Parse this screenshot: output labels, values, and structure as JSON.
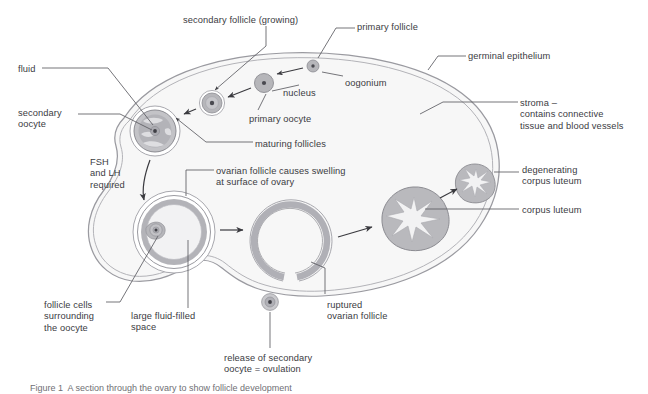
{
  "figure": {
    "kind": "biology-diagram",
    "caption": "Figure 1  A section through the ovary to show follicle development"
  },
  "colors": {
    "outline": "#8c8c92",
    "ovary_fill": "#f7f7f7",
    "follicle_fill": "#b6b6ba",
    "follicle_light": "#d8d8db",
    "corpus_fill": "#b9b9bd",
    "leader_line": "#5c5c62",
    "text": "#3b3b3f",
    "caption_text": "#6f6f74",
    "white": "#ffffff"
  },
  "labels": [
    {
      "id": "secondary-follicle-growing",
      "text": "secondary follicle (growing)",
      "x": 183,
      "y": 15,
      "align": "left"
    },
    {
      "id": "primary-follicle",
      "text": "primary follicle",
      "x": 357,
      "y": 22,
      "align": "left"
    },
    {
      "id": "germinal-epithelium",
      "text": "germinal epithelium",
      "x": 468,
      "y": 51,
      "align": "left"
    },
    {
      "id": "fluid",
      "text": "fluid",
      "x": 18,
      "y": 64,
      "align": "left"
    },
    {
      "id": "oogonium",
      "text": "oogonium",
      "x": 345,
      "y": 78,
      "align": "left"
    },
    {
      "id": "nucleus",
      "text": "nucleus",
      "x": 283,
      "y": 88,
      "align": "left"
    },
    {
      "id": "stroma",
      "text": "stroma –\ncontains connective\ntissue and blood vessels",
      "x": 520,
      "y": 98,
      "align": "left"
    },
    {
      "id": "primary-oocyte",
      "text": "primary oocyte",
      "x": 249,
      "y": 114,
      "align": "left"
    },
    {
      "id": "secondary-oocyte",
      "text": "secondary\noocyte",
      "x": 18,
      "y": 108,
      "align": "left"
    },
    {
      "id": "maturing-follicles",
      "text": "maturing follicles",
      "x": 255,
      "y": 139,
      "align": "left"
    },
    {
      "id": "fsh-and-lh-required",
      "text": "FSH\nand LH\nrequired",
      "x": 90,
      "y": 157,
      "align": "left"
    },
    {
      "id": "ovarian-follicle-swelling",
      "text": "ovarian follicle causes swelling\nat surface of ovary",
      "x": 216,
      "y": 166,
      "align": "left"
    },
    {
      "id": "degenerating-corpus-luteum",
      "text": "degenerating\ncorpus luteum",
      "x": 522,
      "y": 165,
      "align": "left"
    },
    {
      "id": "corpus-luteum",
      "text": "corpus luteum",
      "x": 522,
      "y": 205,
      "align": "left"
    },
    {
      "id": "follicle-cells-surrounding",
      "text": "follicle cells\nsurrounding\nthe oocyte",
      "x": 44,
      "y": 300,
      "align": "left"
    },
    {
      "id": "large-fluid-filled-space",
      "text": "large fluid-filled\nspace",
      "x": 131,
      "y": 311,
      "align": "left"
    },
    {
      "id": "ruptured-ovarian-follicle",
      "text": "ruptured\novarian follicle",
      "x": 327,
      "y": 300,
      "align": "left"
    },
    {
      "id": "release-of-secondary-oocyte",
      "text": "release of secondary\noocyte = ovulation",
      "x": 224,
      "y": 353,
      "align": "left"
    }
  ],
  "structures": [
    {
      "id": "ovary-body",
      "name": "ovary outline with germinal epithelium",
      "cx": 300,
      "cy": 185
    },
    {
      "id": "oogonium-cell",
      "name": "oogonium",
      "cx": 313,
      "cy": 66,
      "r": 6
    },
    {
      "id": "primary-follicle-cell",
      "name": "primary follicle",
      "cx": 264,
      "cy": 83,
      "r": 9.5
    },
    {
      "id": "secondary-follicle-cell",
      "name": "secondary follicle (growing)",
      "cx": 212,
      "cy": 103,
      "r": 12
    },
    {
      "id": "maturing-follicle-cell",
      "name": "maturing follicle with secondary oocyte and fluid",
      "cx": 155,
      "cy": 131,
      "r": 23
    },
    {
      "id": "graafian-follicle",
      "name": "large fluid-filled mature follicle",
      "cx": 174,
      "cy": 232,
      "r": 39
    },
    {
      "id": "ruptured-follicle",
      "name": "ruptured ovarian follicle",
      "cx": 290,
      "cy": 242,
      "r": 39
    },
    {
      "id": "released-oocyte",
      "name": "released secondary oocyte",
      "cx": 270,
      "cy": 302,
      "r": 8
    },
    {
      "id": "corpus-luteum-body",
      "name": "corpus luteum",
      "cx": 413,
      "cy": 215,
      "r": 28
    },
    {
      "id": "degenerating-corpus-luteum-body",
      "name": "degenerating corpus luteum",
      "cx": 475,
      "cy": 181,
      "r": 17
    }
  ],
  "arrows": [
    {
      "id": "oogonium-to-primary",
      "from": "oogonium-cell",
      "to": "primary-follicle-cell"
    },
    {
      "id": "primary-to-secondary",
      "from": "primary-follicle-cell",
      "to": "secondary-follicle-cell"
    },
    {
      "id": "secondary-to-maturing",
      "from": "secondary-follicle-cell",
      "to": "maturing-follicle-cell"
    },
    {
      "id": "maturing-to-graafian",
      "from": "maturing-follicle-cell",
      "to": "graafian-follicle"
    },
    {
      "id": "graafian-to-ruptured",
      "from": "graafian-follicle",
      "to": "ruptured-follicle"
    },
    {
      "id": "ruptured-to-corpus-luteum",
      "from": "ruptured-follicle",
      "to": "corpus-luteum-body"
    },
    {
      "id": "corpus-luteum-to-degenerating",
      "from": "corpus-luteum-body",
      "to": "degenerating-corpus-luteum-body"
    }
  ]
}
